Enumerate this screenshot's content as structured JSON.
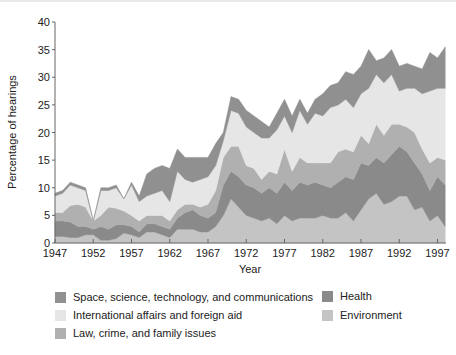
{
  "chart_data": {
    "type": "area",
    "stacked": true,
    "title": "",
    "xlabel": "Year",
    "ylabel": "Percentage of hearings",
    "ylim": [
      0,
      40
    ],
    "xlim": [
      1947,
      1998
    ],
    "grid": false,
    "legend_position": "bottom",
    "y_ticks": [
      0,
      5,
      10,
      15,
      20,
      25,
      30,
      35,
      40
    ],
    "x_ticks": [
      1947,
      1952,
      1957,
      1962,
      1967,
      1972,
      1977,
      1982,
      1987,
      1992,
      1997
    ],
    "x": [
      1947,
      1948,
      1949,
      1950,
      1951,
      1952,
      1953,
      1954,
      1955,
      1956,
      1957,
      1958,
      1959,
      1960,
      1961,
      1962,
      1963,
      1964,
      1965,
      1966,
      1967,
      1968,
      1969,
      1970,
      1971,
      1972,
      1973,
      1974,
      1975,
      1976,
      1977,
      1978,
      1979,
      1980,
      1981,
      1982,
      1983,
      1984,
      1985,
      1986,
      1987,
      1988,
      1989,
      1990,
      1991,
      1992,
      1993,
      1994,
      1995,
      1996,
      1997,
      1998
    ],
    "series": [
      {
        "name": "Environment",
        "color": "#c4c4c4",
        "values": [
          1.2,
          1.2,
          1.0,
          1.0,
          1.5,
          1.5,
          0.5,
          0.5,
          0.8,
          1.8,
          1.5,
          1.0,
          2.0,
          2.0,
          1.5,
          1.0,
          2.5,
          2.5,
          2.5,
          2.0,
          2.0,
          3.0,
          5.0,
          8.0,
          6.5,
          5.0,
          4.5,
          4.0,
          4.5,
          3.5,
          5.0,
          4.0,
          4.5,
          4.5,
          4.5,
          5.0,
          4.5,
          4.5,
          5.5,
          4.0,
          6.0,
          8.0,
          9.0,
          7.0,
          7.5,
          8.5,
          8.5,
          6.0,
          6.5,
          4.0,
          5.0,
          3.0
        ]
      },
      {
        "name": "Health",
        "color": "#8a8a8a",
        "values": [
          2.8,
          2.8,
          2.8,
          2.0,
          1.5,
          1.0,
          2.5,
          2.0,
          2.5,
          1.5,
          1.5,
          1.0,
          1.5,
          1.5,
          1.5,
          1.5,
          2.0,
          3.0,
          3.5,
          3.0,
          2.5,
          2.5,
          5.5,
          5.0,
          5.5,
          5.5,
          5.5,
          5.0,
          5.5,
          5.5,
          6.0,
          5.5,
          6.5,
          6.0,
          6.5,
          5.5,
          5.5,
          6.5,
          6.5,
          7.5,
          8.5,
          6.0,
          6.5,
          7.5,
          8.5,
          9.0,
          8.0,
          8.5,
          6.0,
          5.5,
          7.0,
          7.5
        ]
      },
      {
        "name": "Law, crime, and family issues",
        "color": "#b0b0b0",
        "values": [
          1.5,
          1.5,
          3.0,
          4.0,
          3.5,
          1.5,
          2.0,
          4.0,
          3.0,
          2.5,
          2.0,
          2.0,
          1.5,
          1.5,
          2.0,
          1.5,
          1.5,
          1.5,
          1.0,
          1.5,
          2.5,
          4.0,
          5.0,
          4.5,
          5.5,
          3.5,
          3.5,
          2.5,
          3.0,
          3.5,
          6.0,
          3.5,
          4.5,
          4.0,
          3.5,
          4.0,
          4.5,
          5.5,
          5.0,
          5.0,
          5.0,
          4.0,
          6.0,
          5.0,
          5.5,
          4.0,
          4.5,
          5.5,
          4.5,
          5.0,
          3.5,
          4.5
        ]
      },
      {
        "name": "International affairs and foreign aid",
        "color": "#e6e6e6",
        "values": [
          3.0,
          3.5,
          3.7,
          3.0,
          3.0,
          0.0,
          4.5,
          3.0,
          3.7,
          2.2,
          5.5,
          3.5,
          3.5,
          4.0,
          4.5,
          3.5,
          7.0,
          4.5,
          4.0,
          5.0,
          5.0,
          4.5,
          3.0,
          6.5,
          6.0,
          7.0,
          6.5,
          7.5,
          6.0,
          8.0,
          6.0,
          7.0,
          8.5,
          7.0,
          9.0,
          8.5,
          10.0,
          8.5,
          9.0,
          8.0,
          7.5,
          10.0,
          9.0,
          9.5,
          9.0,
          6.0,
          7.0,
          8.0,
          10.0,
          13.0,
          12.5,
          13.0
        ]
      },
      {
        "name": "Space, science, technology, and communications",
        "color": "#909090",
        "values": [
          0.5,
          0.5,
          0.5,
          0.5,
          0.5,
          0.0,
          0.5,
          0.5,
          0.5,
          0.0,
          0.5,
          1.0,
          4.0,
          4.5,
          4.5,
          6.0,
          4.0,
          4.0,
          4.5,
          4.0,
          3.5,
          4.0,
          1.5,
          2.5,
          2.5,
          3.0,
          3.0,
          3.0,
          2.0,
          3.0,
          3.0,
          3.0,
          2.0,
          2.0,
          2.5,
          4.0,
          4.0,
          4.0,
          5.0,
          6.0,
          5.0,
          7.0,
          2.5,
          4.5,
          4.5,
          4.5,
          4.5,
          4.0,
          4.5,
          7.0,
          5.5,
          7.5
        ]
      }
    ]
  },
  "axes": {
    "ylabel": "Percentage of hearings",
    "xlabel": "Year",
    "y_tick_labels": [
      "0",
      "5",
      "10",
      "15",
      "20",
      "25",
      "30",
      "35",
      "40"
    ],
    "x_tick_labels": [
      "1947",
      "1952",
      "1957",
      "1962",
      "1967",
      "1972",
      "1977",
      "1982",
      "1987",
      "1992",
      "1997"
    ]
  },
  "legend": {
    "items": [
      {
        "label": "Space, science, technology, and communications",
        "color": "#909090"
      },
      {
        "label": "International affairs and foreign aid",
        "color": "#e6e6e6"
      },
      {
        "label": "Law, crime, and family issues",
        "color": "#b0b0b0"
      },
      {
        "label": "Health",
        "color": "#8a8a8a"
      },
      {
        "label": "Environment",
        "color": "#c4c4c4"
      }
    ]
  }
}
